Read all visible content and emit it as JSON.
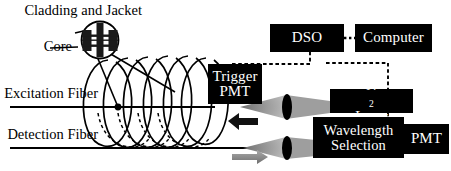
{
  "figure": {
    "type": "optical-instrumentation-schematic"
  },
  "labels": {
    "cladding_and_jacket": "Cladding and\nJacket",
    "cladding_line1": "Cladding and",
    "cladding_line2": "Jacket",
    "core": "Core",
    "excitation_fiber_line1": "Excitation",
    "excitation_fiber_line2": "Fiber",
    "detection_fiber_line1": "Detection",
    "detection_fiber_line2": "Fiber"
  },
  "boxes": {
    "trigger_pmt_line1": "Trigger",
    "trigger_pmt_line2": "PMT",
    "dso": "DSO",
    "computer": "Computer",
    "n2_laser_prefix": "N",
    "n2_laser_sub": "2",
    "n2_laser_suffix": " Laser",
    "wavelength_selection_line1": "Wavelength",
    "wavelength_selection_line2": "Selection",
    "pmt": "PMT"
  },
  "colors": {
    "box_fill": "#000000",
    "box_text": "#ffffff",
    "line": "#000000",
    "beam_cone": "#9b9b9b",
    "arrow_excitation": "#8c8c8c",
    "arrow_detection": "#111111",
    "background": "#ffffff"
  },
  "elements": {
    "fiber_cross_section": "magnified-fiber-cross-section",
    "coil": "helical-fiber-coil",
    "lens_upper": "focusing-lens",
    "lens_lower": "focusing-lens",
    "arrow_left": "left-pointing-arrow",
    "arrow_right": "right-pointing-arrow",
    "signal_link_trigger": "dashed-signal-line",
    "signal_link_dso_pmt": "dashed-signal-line",
    "signal_link_dso_computer": "dotted-signal-line"
  }
}
